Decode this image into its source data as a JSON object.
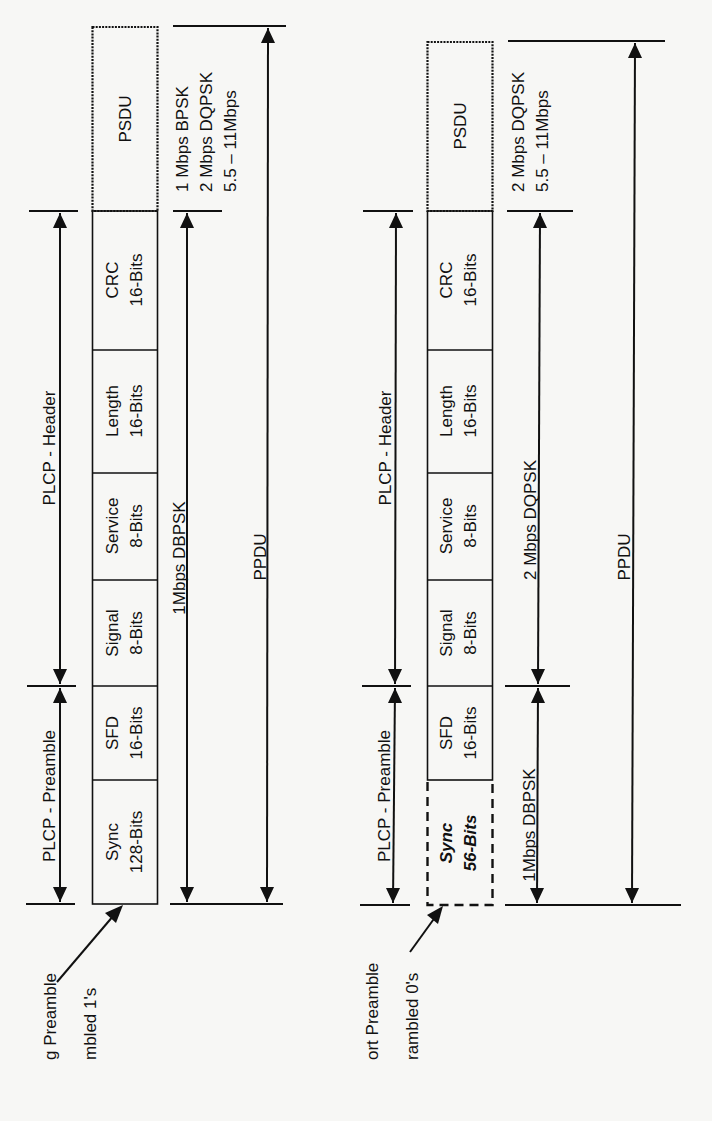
{
  "long_preamble_frame": {
    "fields": [
      {
        "name": "PSDU",
        "bits": ""
      },
      {
        "name": "CRC",
        "bits": "16-Bits"
      },
      {
        "name": "Length",
        "bits": "16-Bits"
      },
      {
        "name": "Service",
        "bits": "8-Bits"
      },
      {
        "name": "Signal",
        "bits": "8-Bits"
      },
      {
        "name": "SFD",
        "bits": "16-Bits"
      },
      {
        "name": "Sync",
        "bits": "128-Bits"
      }
    ],
    "labels": {
      "header": "PLCP - Header",
      "preamble": "PLCP - Preamble",
      "psdu_rates": [
        "1 Mbps BPSK",
        "2 Mbps DQPSK",
        "5.5 – 11Mbps"
      ],
      "plcp_rate": "1Mbps DBPSK",
      "ppdu": "PPDU",
      "callout_line1": "ɡ Preamble",
      "callout_line2": "mbled 1's"
    }
  },
  "short_preamble_frame": {
    "fields": [
      {
        "name": "PSDU",
        "bits": ""
      },
      {
        "name": "CRC",
        "bits": "16-Bits"
      },
      {
        "name": "Length",
        "bits": "16-Bits"
      },
      {
        "name": "Service",
        "bits": "8-Bits"
      },
      {
        "name": "Signal",
        "bits": "8-Bits"
      },
      {
        "name": "SFD",
        "bits": "16-Bits"
      },
      {
        "name": "Sync",
        "bits": "56-Bits"
      }
    ],
    "labels": {
      "header": "PLCP - Header",
      "preamble": "PLCP - Preamble",
      "psdu_rates": [
        "2 Mbps DQPSK",
        "5.5 – 11Mbps"
      ],
      "header_rate": "2 Mbps DQPSK",
      "preamble_rate": "1Mbps DBPSK",
      "ppdu": "PPDU",
      "callout_line1": "ort Preamble",
      "callout_line2": "rambled 0's"
    }
  }
}
